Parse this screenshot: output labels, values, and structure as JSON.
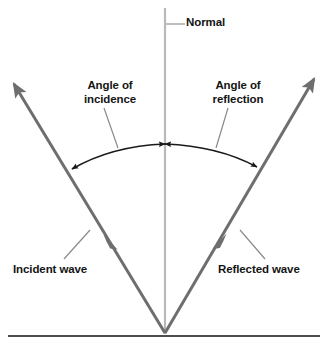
{
  "diagram": {
    "title_text": "Reflection of a wave at a surface",
    "colors": {
      "ray": "#6e6e6e",
      "normal_line": "#b9b9b9",
      "surface_line": "#4d4d4d",
      "arc": "#1a1a1a",
      "leader_line": "#8a8a8a",
      "text": "#141414",
      "background": "#ffffff"
    },
    "labels": {
      "normal": "Normal",
      "angle_of_incidence_line1": "Angle of",
      "angle_of_incidence_line2": "incidence",
      "angle_of_reflection_line1": "Angle of",
      "angle_of_reflection_line2": "reflection",
      "incident_wave": "Incident wave",
      "reflected_wave": "Reflected wave"
    },
    "geometry": {
      "point_of_incidence_x": 165,
      "point_of_incidence_y": 333,
      "incident_ray_start_x": 12,
      "incident_ray_start_y": 82,
      "reflected_ray_end_x": 316,
      "reflected_ray_end_y": 77,
      "normal_top_y": 8,
      "normal_bottom_y": 333,
      "surface_left_x": 8,
      "surface_right_x": 320,
      "surface_y": 336,
      "arc_apex_x": 165,
      "arc_apex_y": 144,
      "arc_left_end_x": 70,
      "arc_left_end_y": 171,
      "arc_right_end_x": 259,
      "arc_right_end_y": 169
    }
  }
}
